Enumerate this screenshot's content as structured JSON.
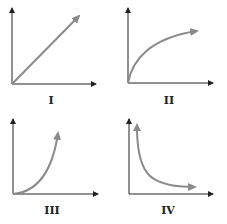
{
  "graphs": [
    {
      "label": "I",
      "curve": "linear increasing"
    },
    {
      "label": "II",
      "curve": "increasing, concave down"
    },
    {
      "label": "III",
      "curve": "increasing, concave up"
    },
    {
      "label": "IV",
      "curve": "decreasing, inverse"
    }
  ],
  "colors": {
    "axis": "#222222",
    "curve": "#8a8a8a"
  }
}
